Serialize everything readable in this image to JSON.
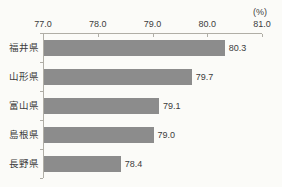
{
  "chart_data": {
    "type": "bar",
    "orientation": "horizontal",
    "title": "",
    "unit_label": "(%)",
    "categories": [
      "福井県",
      "山形県",
      "富山県",
      "島根県",
      "長野県"
    ],
    "values": [
      80.3,
      79.7,
      79.1,
      79.0,
      78.4
    ],
    "value_labels": [
      "80.3",
      "79.7",
      "79.1",
      "79.0",
      "78.4"
    ],
    "x_ticks": [
      77.0,
      78.0,
      79.0,
      80.0,
      81.0
    ],
    "x_tick_labels": [
      "77.0",
      "78.0",
      "79.0",
      "80.0",
      "81.0"
    ],
    "xlim": [
      77.0,
      81.0
    ],
    "axis_position": "top",
    "grid": false,
    "legend": false,
    "bar_color": "#8c8c8c",
    "axis_color": "#b0aea6",
    "text_color": "#3c3c3c",
    "background_color": "#fbfbf8"
  }
}
